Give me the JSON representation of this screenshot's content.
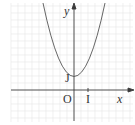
{
  "diagram": {
    "type": "function-graph",
    "function": "y = x^2 + 1",
    "labels": {
      "y_axis": "y",
      "x_axis": "x",
      "origin": "O",
      "unit_i": "I",
      "unit_j": "J"
    },
    "colors": {
      "grid": "#e3e3e3",
      "axes": "#3a3a3a",
      "curve": "#555555"
    }
  }
}
